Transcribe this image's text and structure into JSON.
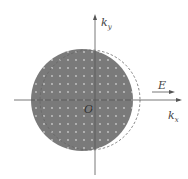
{
  "diagram": {
    "axes": {
      "x_label": "k",
      "x_sub": "x",
      "y_label": "k",
      "y_sub": "y",
      "origin_label": "O"
    },
    "field_label": "E",
    "colors": {
      "fill": "#7a7a7a",
      "dots": "#c8c8c8",
      "axis": "#555555",
      "dashed": "#666666"
    }
  }
}
